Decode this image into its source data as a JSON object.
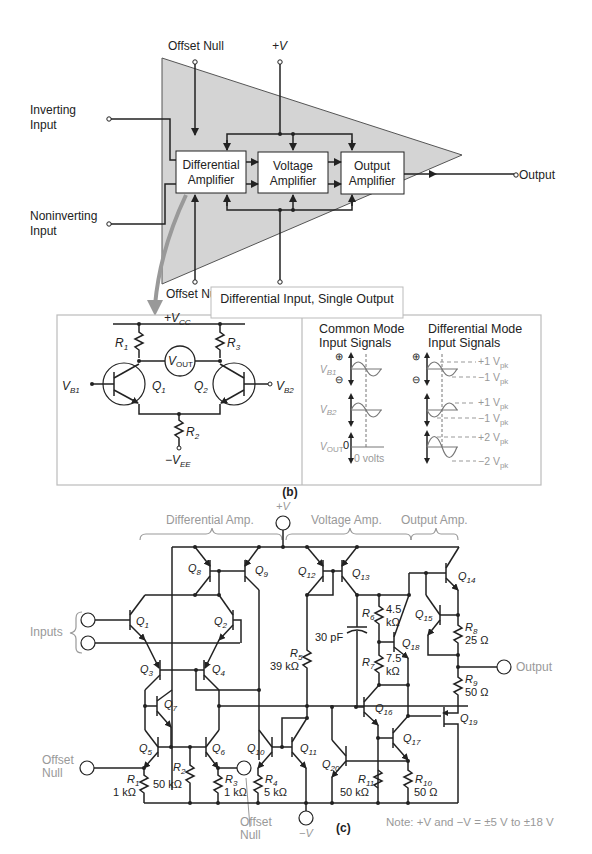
{
  "figure_a": {
    "label": "(a)",
    "offset_null_top": "Offset Null",
    "offset_null_bottom": "Offset Null",
    "plus_v": "+V",
    "minus_v": "−V",
    "inverting_input": [
      "Inverting",
      "Input"
    ],
    "noninverting_input": [
      "Noninverting",
      "Input"
    ],
    "output": "Output",
    "blocks": [
      {
        "line1": "Differential",
        "line2": "Amplifier"
      },
      {
        "line1": "Voltage",
        "line2": "Amplifier"
      },
      {
        "line1": "Output",
        "line2": "Amplifier"
      }
    ],
    "triangle_fill": "#d4d4d4"
  },
  "figure_b": {
    "label": "(b)",
    "title": "Differential Input, Single Output",
    "vcc": "+V",
    "vcc_sub": "CC",
    "vee": "−V",
    "vee_sub": "EE",
    "r1": "R",
    "r1_sub": "1",
    "r2": "R",
    "r2_sub": "2",
    "r3": "R",
    "r3_sub": "3",
    "q1": "Q",
    "q1_sub": "1",
    "q2": "Q",
    "q2_sub": "2",
    "vout": "V",
    "vout_sub": "OUT",
    "vb1": "V",
    "vb1_sub": "B1",
    "vb2": "V",
    "vb2_sub": "B2",
    "common_mode": [
      "Common Mode",
      "Input Signals"
    ],
    "differential_mode": [
      "Differential Mode",
      "Input Signals"
    ],
    "zero": "0",
    "zero_volts": "0 volts",
    "plus_sym": "⊕",
    "minus_sym": "⊖",
    "levels": [
      "+1 V",
      "−1 V",
      "+1 V",
      "−1 V",
      "+2 V",
      "−2 V"
    ],
    "level_sub": "pk"
  },
  "figure_c": {
    "label": "(c)",
    "sections": [
      "Differential Amp.",
      "Voltage Amp.",
      "Output Amp."
    ],
    "plus_v": "+V",
    "minus_v": "−V",
    "inputs": "Inputs",
    "output": "Output",
    "offset_null_left": [
      "Offset",
      "Null"
    ],
    "offset_null_mid": [
      "Offset",
      "Null"
    ],
    "capacitor": "30 pF",
    "note": "Note: +V and −V = ±5 V to ±18 V",
    "transistors": [
      "1",
      "2",
      "3",
      "4",
      "5",
      "6",
      "7",
      "8",
      "9",
      "10",
      "11",
      "12",
      "13",
      "14",
      "15",
      "16",
      "17",
      "18",
      "19",
      "20"
    ],
    "resistors": [
      {
        "name": "1",
        "value": "1 kΩ"
      },
      {
        "name": "2",
        "value": "50 kΩ"
      },
      {
        "name": "3",
        "value": "1 kΩ"
      },
      {
        "name": "4",
        "value": "5 kΩ"
      },
      {
        "name": "5",
        "value": "39 kΩ"
      },
      {
        "name": "6",
        "value": "4.5",
        "value2": "kΩ"
      },
      {
        "name": "7",
        "value": "7.5",
        "value2": "kΩ"
      },
      {
        "name": "8",
        "value": "25 Ω"
      },
      {
        "name": "9",
        "value": "50 Ω"
      },
      {
        "name": "10",
        "value": "50 Ω"
      },
      {
        "name": "11",
        "value": "50 kΩ"
      }
    ]
  }
}
